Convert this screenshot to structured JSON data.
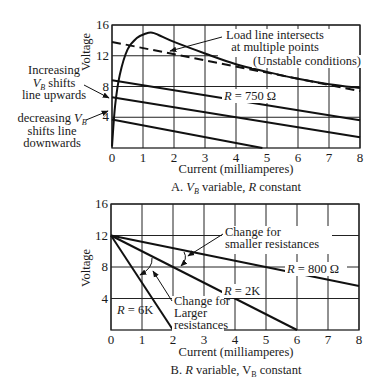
{
  "chart_data": [
    {
      "id": "A",
      "type": "line",
      "caption_prefix": "A.",
      "caption_vb": "V",
      "caption_vb_sub": "B",
      "caption_rest": " variable, ",
      "caption_r": "R",
      "caption_end": " constant",
      "xlabel": "Current (milliamperes)",
      "ylabel": "Voltage",
      "xlim": [
        0,
        8
      ],
      "ylim": [
        0,
        16
      ],
      "xticks": [
        "0",
        "1",
        "2",
        "3",
        "4",
        "5",
        "6",
        "7",
        "8"
      ],
      "yticks": [
        "4",
        "8",
        "12",
        "16"
      ],
      "grid": true,
      "series": [
        {
          "name": "Device characteristic curve",
          "style": "solid",
          "x": [
            0,
            0.1,
            0.25,
            0.5,
            0.8,
            1.1,
            1.3,
            1.5,
            2.0,
            3.0,
            4.0,
            5.0,
            6.0,
            7.0,
            8.0
          ],
          "y": [
            0.2,
            5.5,
            9.5,
            12.8,
            14.3,
            14.9,
            15.0,
            14.7,
            13.8,
            12.3,
            10.9,
            9.9,
            9.0,
            8.3,
            7.8
          ]
        },
        {
          "name": "Load line (unstable)",
          "style": "dashed",
          "x": [
            0,
            8
          ],
          "y": [
            13.8,
            7.4
          ]
        },
        {
          "name": "Load line VB high",
          "style": "solid",
          "x": [
            0,
            8
          ],
          "y": [
            8.8,
            3.6
          ]
        },
        {
          "name": "Load line VB mid",
          "style": "solid",
          "x": [
            0,
            8
          ],
          "y": [
            6.6,
            1.4
          ]
        },
        {
          "name": "Load line VB low",
          "style": "solid",
          "x": [
            0,
            4.85
          ],
          "y": [
            3.7,
            0
          ]
        }
      ],
      "annotations": [
        {
          "lines": [
            "Load line intersects",
            "at multiple points"
          ],
          "x": 3.0,
          "y": 16.6
        },
        {
          "lines": [
            "(Unstable conditions)"
          ],
          "x": 5.25,
          "y": 12.4
        },
        {
          "lines": [
            "R = 750 Ω"
          ],
          "x": 4.3,
          "y": 8.0
        },
        {
          "lines": [
            "Increasing",
            "Vʙ shifts",
            "line upwards"
          ]
        },
        {
          "lines": [
            "decreasing Vʙ",
            "shifts line",
            "downwards"
          ]
        }
      ],
      "labels": {
        "load_line_1": "Load line intersects",
        "load_line_2": "at multiple points",
        "unstable": "(Unstable conditions)",
        "r_prefix": "R",
        "r_value": " = 750 Ω",
        "inc_1": "Increasing",
        "inc_2_v": "V",
        "inc_2_sub": "B",
        "inc_2_rest": " shifts",
        "inc_3": "line upwards",
        "dec_1": "decreasing ",
        "dec_1_v": "V",
        "dec_1_sub": "B",
        "dec_2": "shifts line",
        "dec_3": "downwards"
      }
    },
    {
      "id": "B",
      "type": "line",
      "caption_prefix": "B.",
      "caption_r": "R",
      "caption_rest": " variable, V",
      "caption_sub": "B",
      "caption_end": " constant",
      "xlabel": "Current (milliamperes)",
      "ylabel": "Voltage",
      "xlim": [
        0,
        8
      ],
      "ylim": [
        0,
        16
      ],
      "xticks": [
        "0",
        "1",
        "2",
        "3",
        "4",
        "5",
        "6",
        "7",
        "8"
      ],
      "yticks": [
        "4",
        "8",
        "12",
        "16"
      ],
      "grid": true,
      "series": [
        {
          "name": "R = 6K",
          "style": "solid",
          "x": [
            0,
            2
          ],
          "y": [
            12,
            0
          ]
        },
        {
          "name": "R = 2K",
          "style": "solid",
          "x": [
            0,
            6
          ],
          "y": [
            12,
            0
          ]
        },
        {
          "name": "R = 800 Ω",
          "style": "solid",
          "x": [
            0,
            8
          ],
          "y": [
            12,
            5.6
          ]
        }
      ],
      "labels": {
        "smaller_1": "Change for",
        "smaller_2": "smaller resistances",
        "larger_1": "Change for",
        "larger_2": "Larger",
        "larger_3": "resistances",
        "r800_prefix": "R",
        "r800_value": " = 800 Ω",
        "r2k_prefix": "R",
        "r2k_value": " = 2K",
        "r6k_prefix": "R",
        "r6k_value": " = 6K"
      }
    }
  ]
}
